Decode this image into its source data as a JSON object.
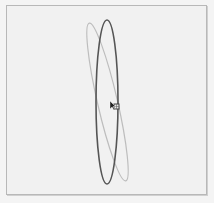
{
  "canvas": {
    "background": "#f1f1f1",
    "border_color": "#b8b8b8"
  },
  "shapes": [
    {
      "name": "ellipse-upright",
      "cx": 107,
      "cy": 102,
      "rx": 11,
      "ry": 82,
      "rotation": 0,
      "stroke": "#555555",
      "stroke_width": 1.6
    },
    {
      "name": "ellipse-tilted",
      "cx": 107.5,
      "cy": 102,
      "rx": 10,
      "ry": 81,
      "rotation": -13,
      "stroke": "#bdbdbd",
      "stroke_width": 1.2
    }
  ],
  "cursor": {
    "icon": "arrow-pointer-icon",
    "x": 110,
    "y": 101
  },
  "selection_handle": {
    "icon": "square-handle-icon",
    "x": 114,
    "y": 104,
    "size": 5
  }
}
